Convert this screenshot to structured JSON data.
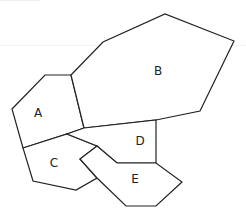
{
  "diagram": {
    "type": "map-regions",
    "regions": [
      {
        "id": "A",
        "label": "A",
        "label_pos": [
          38,
          113
        ],
        "points": "12,109 45,75 71,75 84,128 67,134 23,148"
      },
      {
        "id": "B",
        "label": "B",
        "label_pos": [
          158,
          71
        ],
        "points": "71,75 103,42 165,14 234,41 200,111 156,120 84,128"
      },
      {
        "id": "C",
        "label": "C",
        "label_pos": [
          54,
          163
        ],
        "points": "23,148 67,134 97,146 80,159 97,178 76,190 33,181"
      },
      {
        "id": "D",
        "label": "D",
        "label_pos": [
          140,
          141
        ],
        "points": "84,128 156,120 156,163 117,163 97,146 67,134"
      },
      {
        "id": "E",
        "label": "E",
        "label_pos": [
          135,
          179
        ],
        "points": "97,146 117,163 156,163 182,182 156,206 126,206 97,178 80,159"
      }
    ],
    "stroke_color": "#222222",
    "fill_color": "#ffffff"
  }
}
